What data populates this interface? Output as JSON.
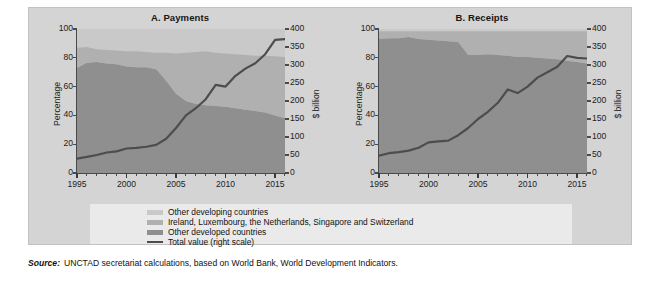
{
  "figure": {
    "source_label": "Source:",
    "source_text": "UNCTAD secretariat calculations, based on World Bank, World Development Indicators."
  },
  "legend": {
    "items": [
      {
        "label": "Other developing countries",
        "color": "#c9c9c9",
        "type": "area"
      },
      {
        "label": "Ireland, Luxembourg, the Netherlands, Singapore and Switzerland",
        "color": "#b0b0b0",
        "type": "area"
      },
      {
        "label": "Other developed countries",
        "color": "#8f8f8f",
        "type": "area"
      },
      {
        "label": "Total value (right scale)",
        "color": "#4d4d4d",
        "type": "line"
      }
    ]
  },
  "colors": {
    "other_developing": "#c9c9c9",
    "hub_economies": "#b0b0b0",
    "other_developed": "#8f8f8f",
    "total_line": "#4d4d4d",
    "panel_background": "#d4d4d4",
    "plot_background": "#b3b3b3",
    "legend_background": "#eaeaea",
    "axis": "#4a4a4a"
  },
  "chart_data": [
    {
      "type": "area",
      "panel": "A",
      "title": "A. Payments",
      "xlabel": "",
      "ylabel": "Percentage",
      "y2label": "$ billion",
      "ylim": [
        0,
        100
      ],
      "y2lim": [
        0,
        400
      ],
      "xlim": [
        1995,
        2016
      ],
      "yticks": [
        0,
        20,
        40,
        60,
        80,
        100
      ],
      "y2ticks": [
        0,
        50,
        100,
        150,
        200,
        250,
        300,
        350,
        400
      ],
      "xticks": [
        1995,
        2000,
        2005,
        2010,
        2015
      ],
      "grid": false,
      "legend_position": "below",
      "stacked": true,
      "x": [
        1995,
        1996,
        1997,
        1998,
        1999,
        2000,
        2001,
        2002,
        2003,
        2004,
        2005,
        2006,
        2007,
        2008,
        2009,
        2010,
        2011,
        2012,
        2013,
        2014,
        2015,
        2016
      ],
      "series": [
        {
          "name": "Other developed countries",
          "color": "#8f8f8f",
          "values": [
            73.0,
            76.5,
            77.0,
            76.0,
            75.5,
            74.0,
            73.5,
            73.5,
            72.0,
            64.0,
            55.0,
            50.0,
            48.0,
            47.0,
            46.5,
            46.0,
            45.0,
            44.0,
            43.0,
            42.0,
            40.0,
            38.0
          ]
        },
        {
          "name": "Ireland, Luxembourg, the Netherlands, Singapore and Switzerland",
          "color": "#b0b0b0",
          "values": [
            14.0,
            11.0,
            9.0,
            9.5,
            9.5,
            10.5,
            11.0,
            10.5,
            11.5,
            19.5,
            28.0,
            33.5,
            36.0,
            37.5,
            37.0,
            37.0,
            37.5,
            38.0,
            38.5,
            39.5,
            41.0,
            42.5
          ]
        },
        {
          "name": "Other developing countries",
          "color": "#c9c9c9",
          "values": [
            13.0,
            12.5,
            14.0,
            14.5,
            15.0,
            15.5,
            15.5,
            16.0,
            16.5,
            16.5,
            17.0,
            16.5,
            16.0,
            15.5,
            16.5,
            17.0,
            17.5,
            18.0,
            18.5,
            18.5,
            19.0,
            19.5
          ]
        }
      ],
      "line_series": {
        "name": "Total value (right scale)",
        "color": "#4d4d4d",
        "axis": "right",
        "values": [
          40,
          45,
          50,
          57,
          60,
          68,
          70,
          73,
          78,
          95,
          125,
          160,
          180,
          205,
          245,
          240,
          270,
          290,
          305,
          330,
          370,
          372
        ]
      }
    },
    {
      "type": "area",
      "panel": "B",
      "title": "B. Receipts",
      "xlabel": "",
      "ylabel": "Percentage",
      "y2label": "$ billion",
      "ylim": [
        0,
        100
      ],
      "y2lim": [
        0,
        400
      ],
      "xlim": [
        1995,
        2016
      ],
      "yticks": [
        0,
        20,
        40,
        60,
        80,
        100
      ],
      "y2ticks": [
        0,
        50,
        100,
        150,
        200,
        250,
        300,
        350,
        400
      ],
      "xticks": [
        1995,
        2000,
        2005,
        2010,
        2015
      ],
      "grid": false,
      "legend_position": "below",
      "stacked": true,
      "x": [
        1995,
        1996,
        1997,
        1998,
        1999,
        2000,
        2001,
        2002,
        2003,
        2004,
        2005,
        2006,
        2007,
        2008,
        2009,
        2010,
        2011,
        2012,
        2013,
        2014,
        2015,
        2016
      ],
      "series": [
        {
          "name": "Other developed countries",
          "color": "#8f8f8f",
          "values": [
            93.0,
            93.5,
            93.5,
            94.5,
            93.0,
            92.5,
            92.0,
            91.5,
            91.0,
            82.0,
            82.0,
            82.5,
            82.0,
            81.5,
            80.5,
            80.5,
            80.0,
            79.5,
            79.0,
            78.0,
            77.0,
            76.0
          ]
        },
        {
          "name": "Ireland, Luxembourg, the Netherlands, Singapore and Switzerland",
          "color": "#b0b0b0",
          "values": [
            5.5,
            5.0,
            5.0,
            4.0,
            5.5,
            6.0,
            6.5,
            7.0,
            7.5,
            16.5,
            16.5,
            16.0,
            16.5,
            17.0,
            18.0,
            18.0,
            18.5,
            19.0,
            19.5,
            20.5,
            21.5,
            22.5
          ]
        },
        {
          "name": "Other developing countries",
          "color": "#c9c9c9",
          "values": [
            1.5,
            1.5,
            1.5,
            1.5,
            1.5,
            1.5,
            1.5,
            1.5,
            1.5,
            1.5,
            1.5,
            1.5,
            1.5,
            1.5,
            1.5,
            1.5,
            1.5,
            1.5,
            1.5,
            1.5,
            1.5,
            1.5
          ]
        }
      ],
      "line_series": {
        "name": "Total value (right scale)",
        "color": "#4d4d4d",
        "axis": "right",
        "values": [
          48,
          55,
          58,
          62,
          70,
          85,
          88,
          90,
          105,
          125,
          150,
          170,
          195,
          232,
          222,
          240,
          265,
          280,
          295,
          325,
          320,
          318
        ]
      }
    }
  ]
}
